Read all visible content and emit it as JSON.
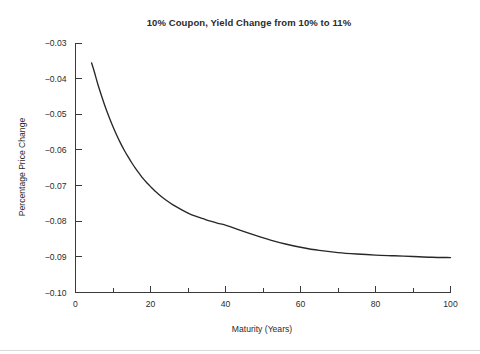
{
  "figure": {
    "background_color": "#ffffff",
    "foreground_color": "#2b2b2b",
    "curve_color": "#27272a"
  },
  "chart_data": {
    "type": "line",
    "title": "10% Coupon, Yield Change from 10% to 11%",
    "xlabel": "Maturity  (Years)",
    "ylabel": "Percentage Price Change",
    "xlim": [
      0,
      100
    ],
    "ylim": [
      -0.1,
      -0.03
    ],
    "grid": false,
    "legend": null,
    "x_major_ticks": [
      0,
      20,
      40,
      60,
      80,
      100
    ],
    "x_major_tick_labels": [
      "0",
      "20",
      "40",
      "60",
      "80",
      "100"
    ],
    "x_minor_ticks": [
      10,
      30,
      50,
      70,
      90
    ],
    "y_major_ticks": [
      -0.03,
      -0.04,
      -0.05,
      -0.06,
      -0.07,
      -0.08,
      -0.09,
      -0.1
    ],
    "y_major_tick_labels": [
      "−0.03",
      "−0.04",
      "−0.05",
      "−0.06",
      "−0.07",
      "−0.08",
      "−0.09",
      "−0.10"
    ],
    "series": [
      {
        "name": "Percentage Price Change",
        "x": [
          4.3,
          5,
          6,
          7,
          8,
          9,
          10,
          11,
          12,
          13,
          14,
          15,
          16,
          17,
          18,
          19,
          20,
          22,
          24,
          26,
          28,
          30,
          32,
          34,
          36,
          38,
          40,
          44,
          48,
          52,
          56,
          60,
          65,
          70,
          75,
          80,
          85,
          90,
          95,
          100
        ],
        "y": [
          -0.0356,
          -0.038,
          -0.0417,
          -0.045,
          -0.0481,
          -0.0509,
          -0.0535,
          -0.0559,
          -0.0581,
          -0.0601,
          -0.0619,
          -0.0636,
          -0.0652,
          -0.0666,
          -0.068,
          -0.0692,
          -0.0703,
          -0.0723,
          -0.074,
          -0.0754,
          -0.0766,
          -0.0777,
          -0.0786,
          -0.0793,
          -0.08,
          -0.0806,
          -0.0811,
          -0.0826,
          -0.084,
          -0.0853,
          -0.0864,
          -0.0873,
          -0.0882,
          -0.0888,
          -0.0892,
          -0.0895,
          -0.0897,
          -0.0899,
          -0.0901,
          -0.0902
        ]
      }
    ]
  }
}
